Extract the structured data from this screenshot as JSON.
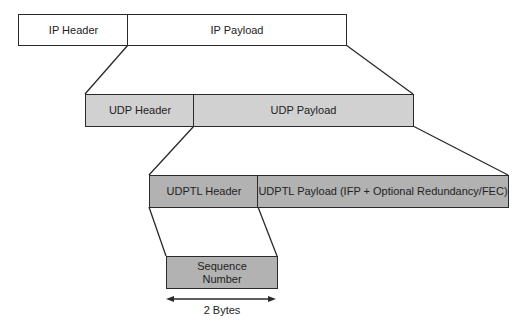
{
  "diagram": {
    "layers": [
      {
        "name": "ip",
        "header": "IP Header",
        "payload": "IP Payload"
      },
      {
        "name": "udp",
        "header": "UDP Header",
        "payload": "UDP Payload"
      },
      {
        "name": "udptl",
        "header": "UDPTL Header",
        "payload": "UDPTL Payload (IFP + Optional Redundancy/FEC)"
      }
    ],
    "sequence": {
      "line1": "Sequence",
      "line2": "Number"
    },
    "dimension_label": "2 Bytes",
    "colors": {
      "ip_fill": "#ffffff",
      "udp_fill": "#d1d1d1",
      "udptl_fill": "#b2b2b2",
      "stroke": "#2a2a2a"
    }
  }
}
